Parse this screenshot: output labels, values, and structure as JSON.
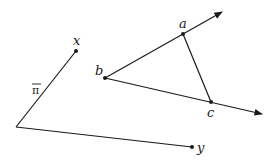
{
  "diagram": {
    "colors": {
      "stroke": "#1a1a1a",
      "background": "#ffffff"
    },
    "left_figure": {
      "origin": [
        16,
        127
      ],
      "points": [
        {
          "label": "x",
          "pos": [
            76,
            51
          ],
          "label_pos": [
            73,
            45
          ]
        },
        {
          "label": "y",
          "pos": [
            192,
            147
          ],
          "label_pos": [
            197,
            152
          ]
        }
      ],
      "edge_label": {
        "text": "π",
        "pos": [
          32,
          93
        ]
      }
    },
    "right_figure": {
      "points": [
        {
          "label": "b",
          "pos": [
            105,
            78
          ],
          "label_pos": [
            95,
            74
          ]
        },
        {
          "label": "a",
          "pos": [
            183,
            34
          ],
          "label_pos": [
            179,
            27
          ]
        },
        {
          "label": "c",
          "pos": [
            211,
            102
          ],
          "label_pos": [
            208,
            116
          ]
        }
      ],
      "ray_ba_end": [
        222,
        12
      ],
      "ray_bc_end": [
        262,
        114
      ]
    }
  }
}
